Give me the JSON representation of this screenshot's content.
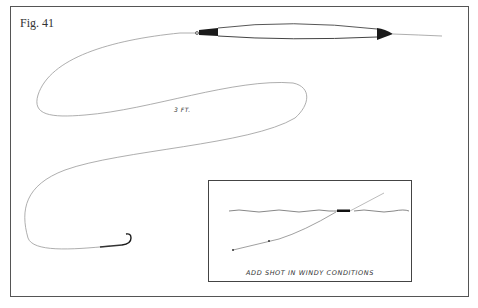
{
  "figure": {
    "label": "Fig. 41",
    "length_label": "3 FT.",
    "elements": [
      "float-with-line-loop",
      "three-foot-leader",
      "hook"
    ],
    "inset": {
      "caption": "ADD SHOT IN WINDY CONDITIONS",
      "elements": [
        "water-surface",
        "float",
        "line",
        "split-shot"
      ]
    },
    "colors": {
      "frame": "#555555",
      "line": "#999999",
      "ink": "#222222"
    }
  }
}
